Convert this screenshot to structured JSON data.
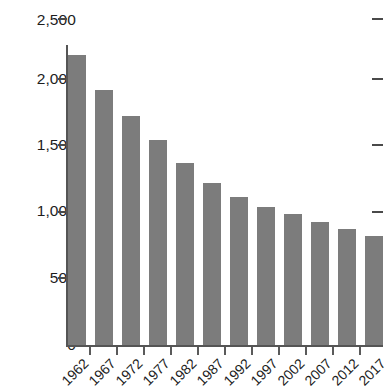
{
  "chart_data": {
    "type": "bar",
    "title": "",
    "subtitle": "",
    "xlabel": "",
    "ylabel": "",
    "categories": [
      "1962",
      "1967",
      "1972",
      "1977",
      "1982",
      "1987",
      "1992",
      "1997",
      "2002",
      "2007",
      "2012",
      "2017"
    ],
    "values": [
      2220,
      1950,
      1750,
      1565,
      1390,
      1240,
      1135,
      1055,
      1000,
      940,
      885,
      835
    ],
    "ylim": [
      0,
      2500
    ],
    "yticks": [
      0,
      500,
      1000,
      1500,
      2000,
      2500
    ],
    "ytick_labels": [
      "0",
      "500",
      "1,000",
      "1,500",
      "2,000",
      "2,500"
    ],
    "grid": false,
    "legend": null,
    "legend_position": "none",
    "bar_color": "#7c7c7c",
    "axis_color": "#555555",
    "annotations": []
  },
  "axis": {
    "y_labels": [
      "2,500",
      "2,000",
      "1,500",
      "1,000",
      "500",
      "0"
    ],
    "x_labels": [
      "1962",
      "1967",
      "1972",
      "1977",
      "1982",
      "1987",
      "1992",
      "1997",
      "2002",
      "2007",
      "2012",
      "2017"
    ]
  }
}
